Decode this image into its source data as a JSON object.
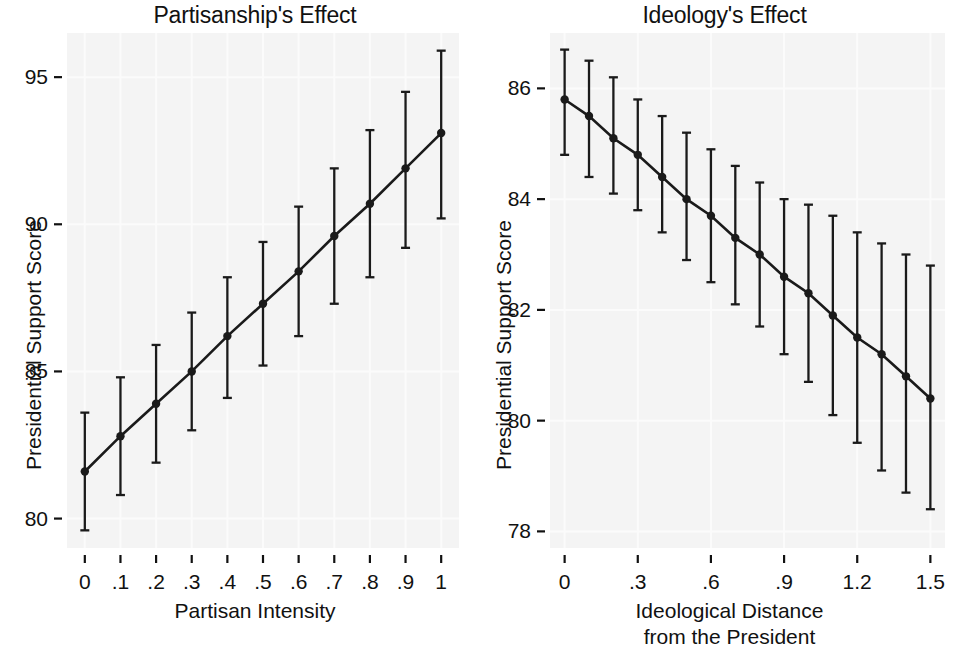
{
  "figure": {
    "width": 959,
    "height": 655,
    "background": "#ffffff",
    "panel_background": "#f4f4f4",
    "gridline_color": "#fbfbfb",
    "series_color": "#1a1a1a"
  },
  "chart_data": [
    {
      "type": "line",
      "title": "Partisanship's Effect",
      "xlabel": "Partisan Intensity",
      "ylabel": "Presidential Support Score",
      "grid": true,
      "legend": null,
      "xlim": [
        -0.05,
        1.05
      ],
      "ylim": [
        79.0,
        96.5
      ],
      "xticks": [
        0,
        0.1,
        0.2,
        0.3,
        0.4,
        0.5,
        0.6,
        0.7,
        0.8,
        0.9,
        1
      ],
      "xticklabels": [
        "0",
        ".1",
        ".2",
        ".3",
        ".4",
        ".5",
        ".6",
        ".7",
        ".8",
        ".9",
        "1"
      ],
      "yticks": [
        80,
        85,
        90,
        95
      ],
      "yticklabels": [
        "80",
        "85",
        "90",
        "95"
      ],
      "x": [
        0,
        0.1,
        0.2,
        0.3,
        0.4,
        0.5,
        0.6,
        0.7,
        0.8,
        0.9,
        1.0
      ],
      "values": [
        81.6,
        82.8,
        83.9,
        85.0,
        86.2,
        87.3,
        88.4,
        89.6,
        90.7,
        91.9,
        93.1
      ],
      "ci_low": [
        79.6,
        80.8,
        81.9,
        83.0,
        84.1,
        85.2,
        86.2,
        87.3,
        88.2,
        89.2,
        90.2
      ],
      "ci_high": [
        83.6,
        84.8,
        85.9,
        87.0,
        88.2,
        89.4,
        90.6,
        91.9,
        93.2,
        94.5,
        95.9
      ],
      "marker": "circle",
      "errorbar_style": "capped"
    },
    {
      "type": "line",
      "title": "Ideology's Effect",
      "xlabel": "Ideological Distance\nfrom the President",
      "xlabel_line1": "Ideological Distance",
      "xlabel_line2": "from the President",
      "ylabel": "Presidential Support Score",
      "grid": true,
      "legend": null,
      "xlim": [
        -0.06,
        1.56
      ],
      "ylim": [
        77.7,
        87.0
      ],
      "xticks": [
        0,
        0.3,
        0.6,
        0.9,
        1.2,
        1.5
      ],
      "xticklabels": [
        "0",
        ".3",
        ".6",
        ".9",
        "1.2",
        "1.5"
      ],
      "yticks": [
        78,
        80,
        82,
        84,
        86
      ],
      "yticklabels": [
        "78",
        "80",
        "82",
        "84",
        "86"
      ],
      "x": [
        0,
        0.1,
        0.2,
        0.3,
        0.4,
        0.5,
        0.6,
        0.7,
        0.8,
        0.9,
        1.0,
        1.1,
        1.2,
        1.3,
        1.4,
        1.5
      ],
      "values": [
        85.8,
        85.5,
        85.1,
        84.8,
        84.4,
        84.0,
        83.7,
        83.3,
        83.0,
        82.6,
        82.3,
        81.9,
        81.5,
        81.2,
        80.8,
        80.4
      ],
      "ci_low": [
        84.8,
        84.4,
        84.1,
        83.8,
        83.4,
        82.9,
        82.5,
        82.1,
        81.7,
        81.2,
        80.7,
        80.1,
        79.6,
        79.1,
        78.7,
        78.4
      ],
      "ci_high": [
        86.7,
        86.5,
        86.2,
        85.8,
        85.5,
        85.2,
        84.9,
        84.6,
        84.3,
        84.0,
        83.9,
        83.7,
        83.4,
        83.2,
        83.0,
        82.8
      ],
      "marker": "circle",
      "errorbar_style": "capped"
    }
  ]
}
